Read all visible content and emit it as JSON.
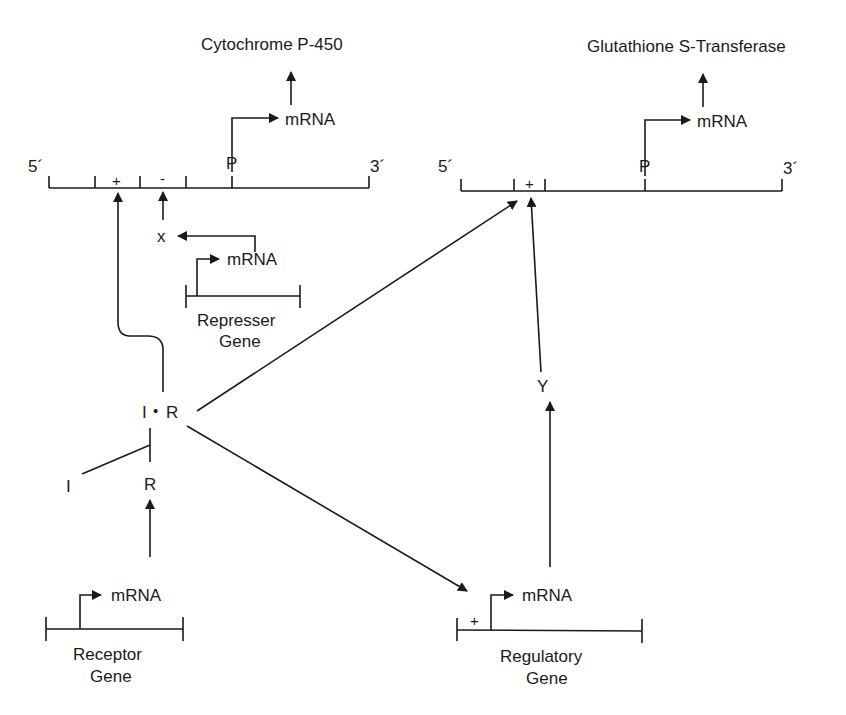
{
  "diagram": {
    "ink_color": "#1a1a1a",
    "background": "#ffffff",
    "left_gene": {
      "product": "Cytochrome P-450",
      "mrna": "mRNA",
      "five_prime": "5´",
      "three_prime": "3´",
      "promoter": "P",
      "plus_site": "+",
      "minus_site": "-"
    },
    "right_gene": {
      "product": "Glutathione S-Transferase",
      "mrna": "mRNA",
      "five_prime": "5´",
      "three_prime": "3´",
      "promoter": "P",
      "plus_site": "+"
    },
    "repressor_gene": {
      "label_line1": "Represser",
      "label_line2": "Gene",
      "mrna": "mRNA",
      "product": "x"
    },
    "receptor_gene": {
      "label_line1": "Receptor",
      "label_line2": "Gene",
      "mrna": "mRNA"
    },
    "regulatory_gene": {
      "label_line1": "Regulatory",
      "label_line2": "Gene",
      "mrna": "mRNA",
      "plus_site": "+",
      "product": "Y"
    },
    "complex": {
      "inducer": "I",
      "dot": "•",
      "receptor": "R",
      "free_inducer": "I",
      "free_receptor": "R"
    }
  }
}
